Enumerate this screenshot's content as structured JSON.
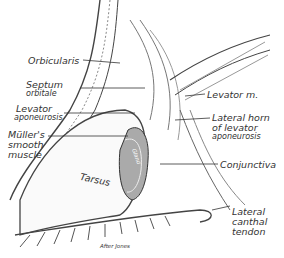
{
  "figure": {
    "labels": [
      {
        "id": "orbicularis",
        "lines": [
          "Orbicularis"
        ]
      },
      {
        "id": "septum",
        "lines": [
          "Septum",
          "orbitale"
        ]
      },
      {
        "id": "levator-aponeurosis",
        "lines": [
          "Levator",
          "aponeurosis"
        ]
      },
      {
        "id": "mullers",
        "lines": [
          "Müller's",
          "smooth",
          "muscle"
        ]
      },
      {
        "id": "tarsus",
        "lines": [
          "Tarsus"
        ]
      },
      {
        "id": "levator-m",
        "lines": [
          "Levator m."
        ]
      },
      {
        "id": "lateral-horn",
        "lines": [
          "Lateral horn",
          "of levator",
          "aponeurosis"
        ]
      },
      {
        "id": "conjunctiva",
        "lines": [
          "Conjunctiva"
        ]
      },
      {
        "id": "lateral-canthal",
        "lines": [
          "Lateral",
          "canthal",
          "tendon"
        ]
      },
      {
        "id": "gland",
        "lines": [
          "Gland"
        ]
      }
    ],
    "credit": "After Jones"
  }
}
